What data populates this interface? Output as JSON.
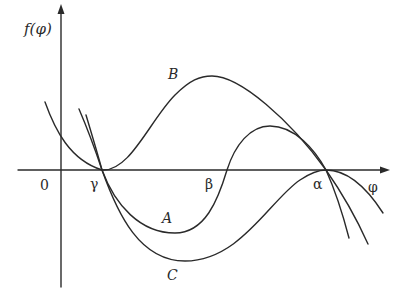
{
  "diagram": {
    "axes": {
      "y_label": "f(φ)",
      "x_label": "φ",
      "origin_label": "0"
    },
    "roots": [
      {
        "name": "gamma",
        "label": "γ"
      },
      {
        "name": "beta",
        "label": "β"
      },
      {
        "name": "alpha",
        "label": "α"
      }
    ],
    "curves": [
      {
        "name": "A",
        "label": "A"
      },
      {
        "name": "B",
        "label": "B"
      },
      {
        "name": "C",
        "label": "C"
      }
    ],
    "colors": {
      "stroke": "#2a2a2a",
      "background": "#ffffff"
    }
  }
}
